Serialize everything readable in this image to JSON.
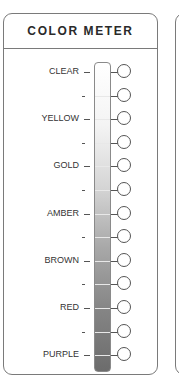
{
  "header": {
    "title": "COLOR METER"
  },
  "meter": {
    "levels": [
      {
        "label": "CLEAR",
        "type": "major"
      },
      {
        "label": "-",
        "type": "minor"
      },
      {
        "label": "YELLOW",
        "type": "major"
      },
      {
        "label": "-",
        "type": "minor"
      },
      {
        "label": "GOLD",
        "type": "major"
      },
      {
        "label": "-",
        "type": "minor"
      },
      {
        "label": "AMBER",
        "type": "major"
      },
      {
        "label": "-",
        "type": "minor"
      },
      {
        "label": "BROWN",
        "type": "major"
      },
      {
        "label": "-",
        "type": "minor"
      },
      {
        "label": "RED",
        "type": "major"
      },
      {
        "label": "-",
        "type": "minor"
      },
      {
        "label": "PURPLE",
        "type": "major"
      }
    ],
    "gradient": {
      "top": "#ffffff",
      "bottom": "#6c6c6c"
    }
  }
}
